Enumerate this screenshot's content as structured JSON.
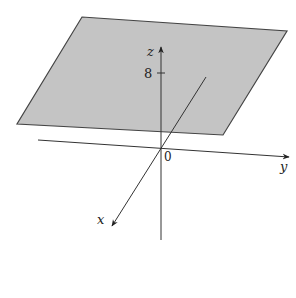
{
  "diagram": {
    "type": "3d-coordinate-axes-with-horizontal-plane",
    "plane": {
      "description": "horizontal plane z = 8",
      "fill": "#c4c4c4",
      "stroke": "#444444",
      "corners": [
        [
          82,
          17
        ],
        [
          287,
          31
        ],
        [
          223,
          135
        ],
        [
          17,
          124
        ]
      ]
    },
    "axes": {
      "z": {
        "label": "z",
        "tick_label": "8"
      },
      "y": {
        "label": "y"
      },
      "x": {
        "label": "x"
      },
      "origin_label": "0"
    },
    "colors": {
      "line": "#333333",
      "background": "#ffffff"
    }
  }
}
